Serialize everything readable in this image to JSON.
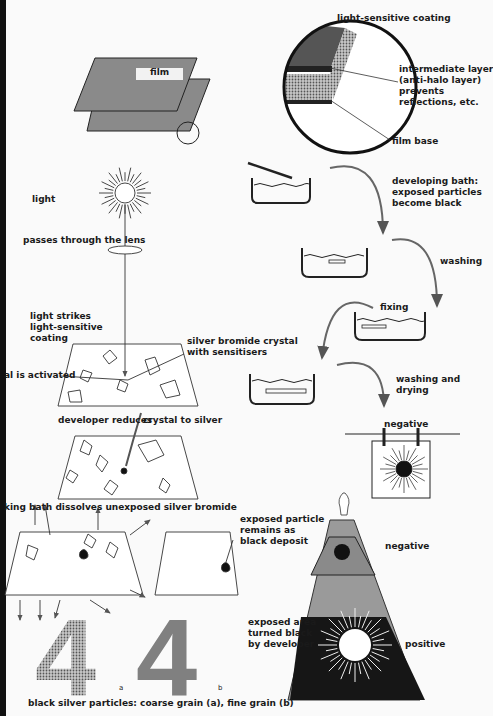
{
  "labels": {
    "film": "film",
    "coating": "light-sensitive coating",
    "intermediate": [
      "intermediate layer",
      "(anti-halo layer)",
      "prevents",
      "reflections, etc."
    ],
    "film_base": "film base",
    "light": "light",
    "lens": "passes through the lens",
    "strikes": [
      "light strikes",
      "light-sensitive",
      "coating"
    ],
    "crystal": [
      "silver bromide crystal",
      "with sensitisers"
    ],
    "activated": "al is activated",
    "developer_reduces": "developer reduces",
    "crystal_to_silver": "crystal to silver",
    "fixing_bath": "king bath dissolves unexposed silver bromide",
    "exposed_particle": [
      "exposed particle",
      "remains as",
      "black deposit"
    ],
    "grain": "black silver particles: coarse grain (a), fine grain (b)",
    "grain_a": "a",
    "grain_b": "b",
    "digit": "4",
    "developing": [
      "developing bath:",
      "exposed particles",
      "become black"
    ],
    "washing": "washing",
    "fixing": "fixing",
    "washing_drying": [
      "washing and",
      "drying"
    ],
    "negative_hang": "negative",
    "negative_proj": "negative",
    "exposed_area": [
      "exposed area",
      "turned black",
      "by developer"
    ],
    "positive": "positive"
  },
  "colors": {
    "gray": "#8a8a8a",
    "light_gray": "#a9a9a9",
    "black": "#141414",
    "paper": "#fafafa"
  }
}
